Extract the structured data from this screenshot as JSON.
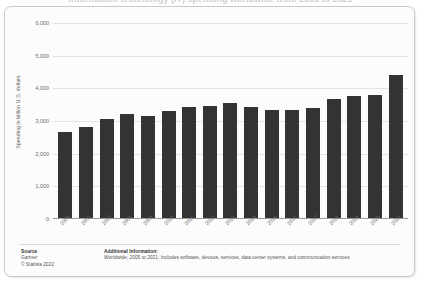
{
  "clipped_title": "Information technology (IT) spending worldwide from 2005 to 2021",
  "chart_data": {
    "type": "bar",
    "title": "",
    "subtitle": "",
    "xlabel": "",
    "ylabel": "Spending in billion U.S. dollars",
    "ylim": [
      0,
      6000
    ],
    "ytick_labels": [
      "0",
      "1,000",
      "2,000",
      "3,000",
      "4,000",
      "5,000",
      "6,000"
    ],
    "ytick_values": [
      0,
      1000,
      2000,
      3000,
      4000,
      5000,
      6000
    ],
    "grid": true,
    "legend": "none",
    "bar_color": "#333333",
    "categories": [
      "2005",
      "2006",
      "2007",
      "2008",
      "2009",
      "2010",
      "2011",
      "2012",
      "2013",
      "2014",
      "2015",
      "2016",
      "2017",
      "2018",
      "2019",
      "2020",
      "2021"
    ],
    "values": [
      2650,
      2800,
      3050,
      3200,
      3130,
      3300,
      3420,
      3450,
      3540,
      3420,
      3330,
      3330,
      3400,
      3650,
      3740,
      3800,
      4400
    ],
    "series": [
      {
        "name": "IT spending",
        "values": [
          2650,
          2800,
          3050,
          3200,
          3130,
          3300,
          3420,
          3450,
          3540,
          3420,
          3330,
          3330,
          3400,
          3650,
          3740,
          3800,
          4400
        ]
      }
    ]
  },
  "bars": [
    {
      "year": "2005",
      "value": 2650
    },
    {
      "year": "2006",
      "value": 2800
    },
    {
      "year": "2007",
      "value": 3050
    },
    {
      "year": "2008",
      "value": 3200
    },
    {
      "year": "2009",
      "value": 3130
    },
    {
      "year": "2010",
      "value": 3300
    },
    {
      "year": "2011",
      "value": 3420
    },
    {
      "year": "2012",
      "value": 3450
    },
    {
      "year": "2013",
      "value": 3540
    },
    {
      "year": "2014",
      "value": 3420
    },
    {
      "year": "2015",
      "value": 3330
    },
    {
      "year": "2016",
      "value": 3330
    },
    {
      "year": "2017",
      "value": 3400
    },
    {
      "year": "2018",
      "value": 3650
    },
    {
      "year": "2019",
      "value": 3740
    },
    {
      "year": "2020",
      "value": 3800
    },
    {
      "year": "2021",
      "value": 4400
    }
  ],
  "footer": {
    "source_heading": "Source",
    "source_lines": [
      "Gartner",
      "© Statista 2022"
    ],
    "additional_heading": "Additional Information:",
    "additional_text": "Worldwide; 2005 to 2021; Includes software, devices, services, data center systems, and communication services"
  }
}
